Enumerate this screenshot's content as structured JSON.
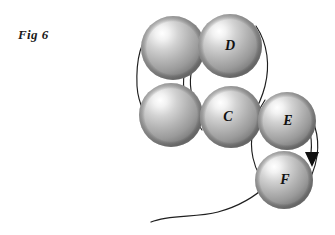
{
  "figure": {
    "caption": "Fig 6",
    "background_color": "#ffffff",
    "line_color": "#1f1f1f",
    "label_color": "#111111",
    "sphere_highlight_color": "#ffffff",
    "sphere_midtone_color": "#b9b9b9",
    "sphere_shadow_color": "#6e6e6e",
    "width": 335,
    "height": 235
  },
  "spheres": [
    {
      "id": "sphere-top-left",
      "label": "",
      "cx": 173,
      "cy": 48,
      "r": 32
    },
    {
      "id": "sphere-d",
      "label": "D",
      "cx": 230,
      "cy": 46,
      "r": 32
    },
    {
      "id": "sphere-bottom-left",
      "label": "",
      "cx": 171,
      "cy": 115,
      "r": 32
    },
    {
      "id": "sphere-c",
      "label": "C",
      "cx": 231,
      "cy": 117,
      "r": 31
    },
    {
      "id": "sphere-e",
      "label": "E",
      "cx": 287,
      "cy": 121,
      "r": 29
    },
    {
      "id": "sphere-f",
      "label": "F",
      "cx": 284,
      "cy": 180,
      "r": 29
    }
  ],
  "labels": {
    "c": "C",
    "d": "D",
    "e": "E",
    "f": "F"
  },
  "connectors": [
    {
      "id": "bond-left-outer",
      "from": "sphere-top-left",
      "to": "sphere-bottom-left"
    },
    {
      "id": "bond-left-inner",
      "from": "sphere-top-left",
      "to": "sphere-bottom-left"
    },
    {
      "id": "bond-d-to-c-right",
      "from": "sphere-d",
      "to": "sphere-c"
    },
    {
      "id": "bond-c-to-e",
      "from": "sphere-c",
      "to": "sphere-e"
    },
    {
      "id": "bond-e-to-f-left",
      "from": "sphere-e",
      "to": "sphere-f"
    },
    {
      "id": "bond-e-to-f-right",
      "from": "sphere-e",
      "to": "sphere-f"
    },
    {
      "id": "tail-curve-into-f",
      "from": "tail",
      "to": "sphere-f"
    }
  ],
  "arrow": {
    "id": "arrow-down",
    "direction": "down",
    "tip_x": 312,
    "tip_y": 165
  }
}
